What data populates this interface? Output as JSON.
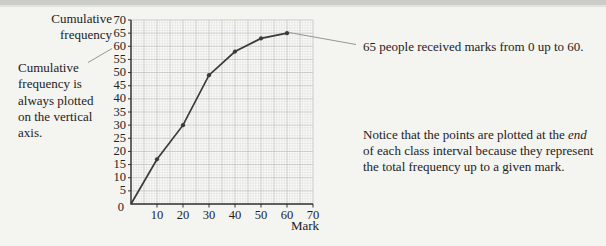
{
  "chart_data": {
    "type": "line",
    "xlabel": "Mark",
    "ylabel": "Cumulative frequency",
    "ylabel_lines": [
      "Cumulative",
      "frequency"
    ],
    "x": [
      0,
      10,
      20,
      30,
      40,
      50,
      60
    ],
    "y": [
      0,
      17,
      30,
      49,
      58,
      63,
      65
    ],
    "xlim": [
      0,
      70
    ],
    "ylim": [
      0,
      70
    ],
    "x_tick_labels": [
      "10",
      "20",
      "30",
      "40",
      "50",
      "60",
      "70"
    ],
    "y_tick_labels": [
      "5",
      "10",
      "15",
      "20",
      "25",
      "30",
      "35",
      "40",
      "45",
      "50",
      "55",
      "60",
      "65",
      "70"
    ],
    "origin_label": "0",
    "grid": "minor every 1 unit, major every 5 units",
    "legend": "none",
    "line_color": "#3a3a3a",
    "grid_minor_color": "#dcdcda",
    "grid_major_color": "#b9b9b6",
    "axis_color": "#333333",
    "plot_bg": "#fbfbf9"
  },
  "annotations": {
    "ylabel_callout": {
      "lines": [
        "Cumulative",
        "frequency is",
        "always plotted",
        "on the vertical",
        "axis."
      ]
    },
    "point_note": "65 people received marks from 0 up to 60.",
    "bottom_note_lines": [
      [
        {
          "t": "Notice that the points are plotted at the "
        },
        {
          "t": "end",
          "i": true
        }
      ],
      [
        {
          "t": "of each class interval because they represent"
        }
      ],
      [
        {
          "t": "the total frequency up to a given mark."
        }
      ]
    ]
  }
}
